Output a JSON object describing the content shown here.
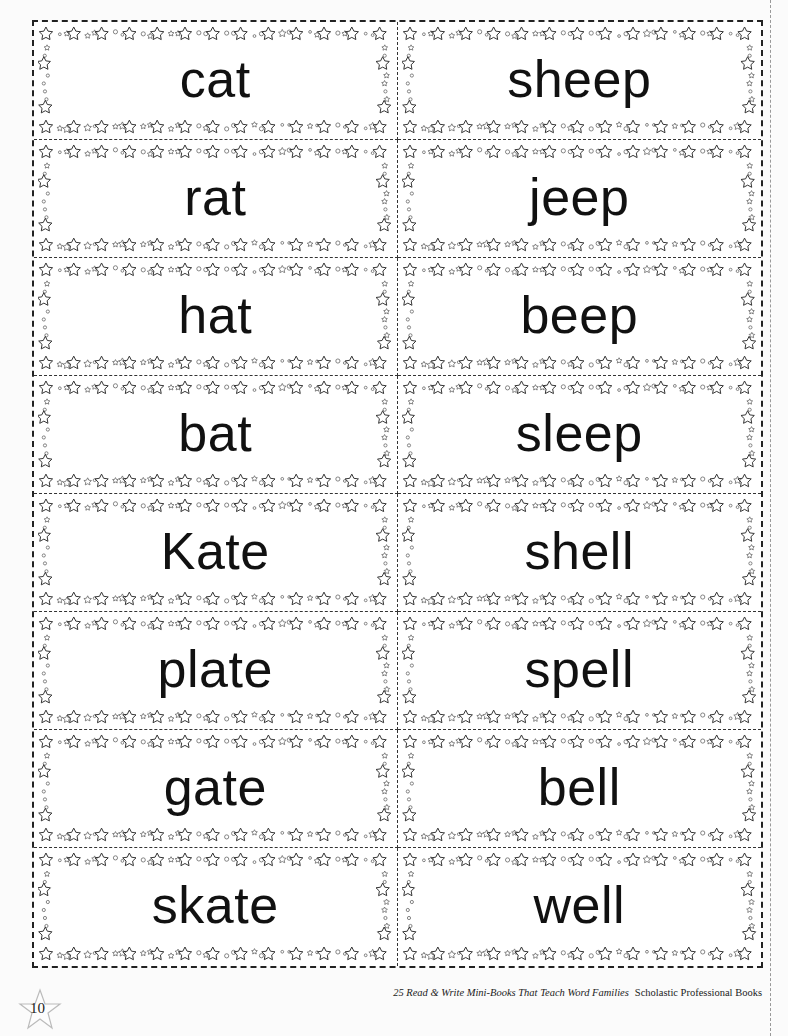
{
  "cards": [
    {
      "left": "cat",
      "right": "sheep"
    },
    {
      "left": "rat",
      "right": "jeep"
    },
    {
      "left": "hat",
      "right": "beep"
    },
    {
      "left": "bat",
      "right": "sleep"
    },
    {
      "left": "Kate",
      "right": "shell"
    },
    {
      "left": "plate",
      "right": "spell"
    },
    {
      "left": "gate",
      "right": "bell"
    },
    {
      "left": "skate",
      "right": "well"
    }
  ],
  "footer": {
    "page_number": "10",
    "book_title": "25 Read & Write Mini-Books That Teach Word Families",
    "publisher": "Scholastic Professional Books"
  },
  "decoration": {
    "frame_icon": "star-border-icon",
    "page_number_icon": "star-icon",
    "ink_color": "#222222"
  }
}
